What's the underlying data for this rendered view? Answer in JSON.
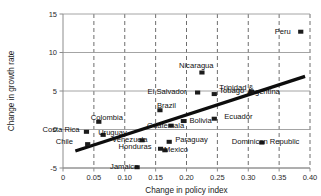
{
  "chart_data": {
    "type": "scatter",
    "title": "",
    "xlabel": "Change in policy index",
    "ylabel": "Change in growth rate",
    "xlim": [
      0,
      0.4
    ],
    "ylim": [
      -5,
      15
    ],
    "xticks": [
      "0",
      "0.05",
      "0.10",
      "0.15",
      "0.20",
      "0.25",
      "0.30",
      "0.35",
      "0.40"
    ],
    "xtick_values": [
      0,
      0.05,
      0.1,
      0.15,
      0.2,
      0.25,
      0.3,
      0.35,
      0.4
    ],
    "yticks": [
      "-5",
      "0",
      "5",
      "10",
      "15"
    ],
    "ytick_values": [
      -5,
      0,
      5,
      10,
      15
    ],
    "grid": "horizontal solid gridlines at y ticks, vertical dashed gridlines at x ticks",
    "legend": "none",
    "marker_style": "filled black square",
    "points": [
      {
        "label": "Peru",
        "x": 0.385,
        "y": 12.7,
        "lx": -26,
        "ly": 2.0
      },
      {
        "label": "Nicaragua",
        "x": 0.225,
        "y": 7.4,
        "lx": -23,
        "ly": -4.5
      },
      {
        "label": "El Salvador",
        "x": 0.218,
        "y": 4.8,
        "lx": -50,
        "ly": 1.2
      },
      {
        "label": "Trinidad &",
        "x": 0.245,
        "y": 4.6,
        "lx": 5,
        "ly": -3.6
      },
      {
        "label": "Tobago",
        "x": 0.245,
        "y": 4.6,
        "lx": 5,
        "ly": -1.4
      },
      {
        "label": "Argentina",
        "x": 0.305,
        "y": 4.9,
        "lx": -4,
        "ly": 2.3
      },
      {
        "label": "Brazil",
        "x": 0.157,
        "y": 2.5,
        "lx": -3,
        "ly": -2.1
      },
      {
        "label": "Ecuador",
        "x": 0.245,
        "y": 1.4,
        "lx": 10,
        "ly": 0.3
      },
      {
        "label": "Bolivia",
        "x": 0.195,
        "y": 1.1,
        "lx": 6,
        "ly": 1.6
      },
      {
        "label": "Colombia",
        "x": 0.058,
        "y": 1.0,
        "lx": -8,
        "ly": -1.6
      },
      {
        "label": "Guatemala",
        "x": 0.175,
        "y": 0.5,
        "lx": -24,
        "ly": 2.1
      },
      {
        "label": "Costa Rica",
        "x": 0.038,
        "y": -0.3,
        "lx": -44,
        "ly": 0.1
      },
      {
        "label": "Uruguay",
        "x": 0.065,
        "y": -0.7,
        "lx": -5,
        "ly": 0.2
      },
      {
        "label": "Venezuela",
        "x": 0.128,
        "y": -1.4,
        "lx": -30,
        "ly": 1.6
      },
      {
        "label": "Chile",
        "x": 0.04,
        "y": -1.9,
        "lx": -32,
        "ly": 0.3
      },
      {
        "label": "Paraguay",
        "x": 0.172,
        "y": -1.6,
        "lx": 6,
        "ly": 0.3
      },
      {
        "label": "Dominican Republic",
        "x": 0.322,
        "y": -1.7,
        "lx": -30,
        "ly": 1.9
      },
      {
        "label": "Honduras",
        "x": 0.158,
        "y": -2.5,
        "lx": -42,
        "ly": 0.4
      },
      {
        "label": "Mexico",
        "x": 0.165,
        "y": -2.7,
        "lx": -1,
        "ly": 1.6
      },
      {
        "label": "Jamaica",
        "x": 0.12,
        "y": -4.9,
        "lx": -27,
        "ly": 1.4
      }
    ],
    "trendline": {
      "x0": 0.02,
      "y0": -2.8,
      "x1": 0.392,
      "y1": 6.9
    }
  }
}
